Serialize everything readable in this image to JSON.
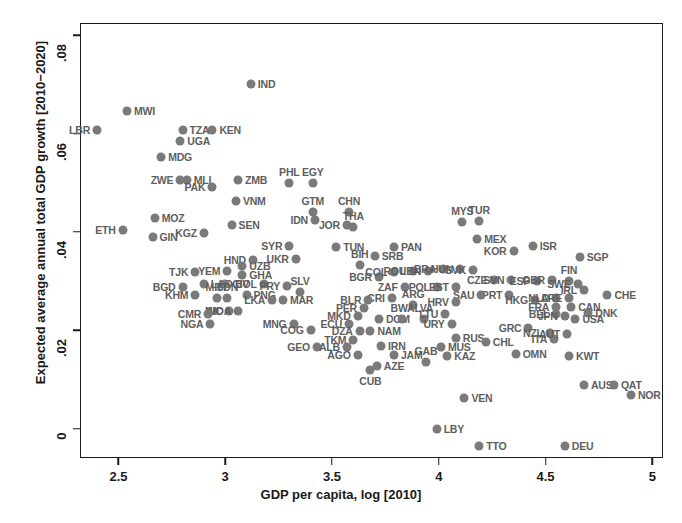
{
  "chart_data": {
    "type": "scatter",
    "title": "",
    "xlabel": "GDP per capita, log [2010]",
    "ylabel": "Expected average annual total GDP growth [2010−2020]",
    "xlim": [
      2.32,
      5.05
    ],
    "ylim": [
      -0.006,
      0.0825
    ],
    "xticks": [
      "2.5",
      "3",
      "3.5",
      "4",
      "4.5",
      "5"
    ],
    "xtick_values": [
      2.5,
      3,
      3.5,
      4,
      4.5,
      5
    ],
    "yticks": [
      "0",
      ".02",
      ".04",
      ".06",
      ".08"
    ],
    "ytick_values": [
      0,
      0.02,
      0.04,
      0.06,
      0.08
    ],
    "grid": false,
    "legend": null,
    "marker_color": "#7a7a7a",
    "label_color": "#5e5e5e",
    "axis_color": "#1a1a1a",
    "points": [
      {
        "label": "LBR",
        "x": 2.4,
        "y": 0.0608,
        "lp": "left"
      },
      {
        "label": "MWI",
        "x": 2.54,
        "y": 0.0645,
        "lp": "right"
      },
      {
        "label": "TZA",
        "x": 2.8,
        "y": 0.0608,
        "lp": "right"
      },
      {
        "label": "UGA",
        "x": 2.79,
        "y": 0.0585,
        "lp": "right"
      },
      {
        "label": "KEN",
        "x": 2.94,
        "y": 0.0608,
        "lp": "right"
      },
      {
        "label": "MDG",
        "x": 2.7,
        "y": 0.0553,
        "lp": "right"
      },
      {
        "label": "ZWE",
        "x": 2.79,
        "y": 0.0505,
        "lp": "left"
      },
      {
        "label": "MLI",
        "x": 2.82,
        "y": 0.0505,
        "lp": "right"
      },
      {
        "label": "PAK",
        "x": 2.94,
        "y": 0.0492,
        "lp": "left"
      },
      {
        "label": "ZMB",
        "x": 3.06,
        "y": 0.0505,
        "lp": "right"
      },
      {
        "label": "PHL",
        "x": 3.3,
        "y": 0.05,
        "lp": "above"
      },
      {
        "label": "EGY",
        "x": 3.41,
        "y": 0.05,
        "lp": "above"
      },
      {
        "label": "IND",
        "x": 3.12,
        "y": 0.07,
        "lp": "right"
      },
      {
        "label": "VNM",
        "x": 3.05,
        "y": 0.0462,
        "lp": "right"
      },
      {
        "label": "MOZ",
        "x": 2.67,
        "y": 0.0428,
        "lp": "right"
      },
      {
        "label": "ETH",
        "x": 2.52,
        "y": 0.0403,
        "lp": "left"
      },
      {
        "label": "GIN",
        "x": 2.66,
        "y": 0.039,
        "lp": "right"
      },
      {
        "label": "KGZ",
        "x": 2.9,
        "y": 0.0398,
        "lp": "left"
      },
      {
        "label": "SEN",
        "x": 3.03,
        "y": 0.0415,
        "lp": "right"
      },
      {
        "label": "GTM",
        "x": 3.41,
        "y": 0.044,
        "lp": "above"
      },
      {
        "label": "IDN",
        "x": 3.42,
        "y": 0.0425,
        "lp": "left"
      },
      {
        "label": "CHN",
        "x": 3.58,
        "y": 0.044,
        "lp": "above"
      },
      {
        "label": "JOR",
        "x": 3.57,
        "y": 0.0415,
        "lp": "left"
      },
      {
        "label": "THA",
        "x": 3.6,
        "y": 0.041,
        "lp": "above"
      },
      {
        "label": "MYS",
        "x": 4.11,
        "y": 0.042,
        "lp": "above"
      },
      {
        "label": "TUR",
        "x": 4.19,
        "y": 0.0422,
        "lp": "above"
      },
      {
        "label": "MEX",
        "x": 4.18,
        "y": 0.0385,
        "lp": "right"
      },
      {
        "label": "SYR",
        "x": 3.3,
        "y": 0.0372,
        "lp": "left"
      },
      {
        "label": "HND",
        "x": 3.13,
        "y": 0.0343,
        "lp": "left"
      },
      {
        "label": "UKR",
        "x": 3.33,
        "y": 0.0345,
        "lp": "left"
      },
      {
        "label": "TUN",
        "x": 3.52,
        "y": 0.037,
        "lp": "right"
      },
      {
        "label": "PAN",
        "x": 3.79,
        "y": 0.037,
        "lp": "right"
      },
      {
        "label": "SRB",
        "x": 3.7,
        "y": 0.035,
        "lp": "right"
      },
      {
        "label": "BIH",
        "x": 3.63,
        "y": 0.0332,
        "lp": "above"
      },
      {
        "label": "UZB",
        "x": 3.08,
        "y": 0.033,
        "lp": "right"
      },
      {
        "label": "GHA",
        "x": 3.08,
        "y": 0.0312,
        "lp": "right"
      },
      {
        "label": "YEM",
        "x": 3.01,
        "y": 0.032,
        "lp": "left"
      },
      {
        "label": "TJK",
        "x": 2.86,
        "y": 0.0318,
        "lp": "left"
      },
      {
        "label": "BGD",
        "x": 2.8,
        "y": 0.0288,
        "lp": "left"
      },
      {
        "label": "LAO",
        "x": 2.9,
        "y": 0.0295,
        "lp": "right"
      },
      {
        "label": "CIV",
        "x": 3.0,
        "y": 0.0295,
        "lp": "right"
      },
      {
        "label": "KHM",
        "x": 2.86,
        "y": 0.0272,
        "lp": "left"
      },
      {
        "label": "BOL",
        "x": 3.18,
        "y": 0.0295,
        "lp": "left"
      },
      {
        "label": "PRY",
        "x": 3.29,
        "y": 0.029,
        "lp": "left"
      },
      {
        "label": "PNG",
        "x": 3.1,
        "y": 0.0272,
        "lp": "right"
      },
      {
        "label": "MRT",
        "x": 2.96,
        "y": 0.0265,
        "lp": "above"
      },
      {
        "label": "SDN",
        "x": 3.01,
        "y": 0.0265,
        "lp": "above"
      },
      {
        "label": "LKA",
        "x": 3.22,
        "y": 0.0262,
        "lp": "left"
      },
      {
        "label": "MAR",
        "x": 3.27,
        "y": 0.0262,
        "lp": "right"
      },
      {
        "label": "SLV",
        "x": 3.35,
        "y": 0.0278,
        "lp": "above"
      },
      {
        "label": "BGR",
        "x": 3.72,
        "y": 0.0308,
        "lp": "left"
      },
      {
        "label": "COL",
        "x": 3.79,
        "y": 0.0318,
        "lp": "left"
      },
      {
        "label": "ROU",
        "x": 3.88,
        "y": 0.032,
        "lp": "left"
      },
      {
        "label": "LBN",
        "x": 3.95,
        "y": 0.032,
        "lp": "left"
      },
      {
        "label": "BRA",
        "x": 4.02,
        "y": 0.0325,
        "lp": "left"
      },
      {
        "label": "HUN",
        "x": 4.1,
        "y": 0.0325,
        "lp": "left"
      },
      {
        "label": "SVK",
        "x": 4.16,
        "y": 0.0322,
        "lp": "left"
      },
      {
        "label": "CZE",
        "x": 4.26,
        "y": 0.0302,
        "lp": "left"
      },
      {
        "label": "SVN",
        "x": 4.34,
        "y": 0.0302,
        "lp": "left"
      },
      {
        "label": "KOR",
        "x": 4.35,
        "y": 0.0362,
        "lp": "left"
      },
      {
        "label": "ISR",
        "x": 4.44,
        "y": 0.0372,
        "lp": "right"
      },
      {
        "label": "SGP",
        "x": 4.66,
        "y": 0.0348,
        "lp": "right"
      },
      {
        "label": "ESP",
        "x": 4.46,
        "y": 0.03,
        "lp": "left"
      },
      {
        "label": "GBR",
        "x": 4.53,
        "y": 0.0302,
        "lp": "left"
      },
      {
        "label": "FIN",
        "x": 4.61,
        "y": 0.03,
        "lp": "above"
      },
      {
        "label": "SWE",
        "x": 4.65,
        "y": 0.0295,
        "lp": "left"
      },
      {
        "label": "IRL",
        "x": 4.68,
        "y": 0.0282,
        "lp": "left"
      },
      {
        "label": "CHE",
        "x": 4.79,
        "y": 0.0272,
        "lp": "right"
      },
      {
        "label": "ZAF",
        "x": 3.84,
        "y": 0.0288,
        "lp": "left"
      },
      {
        "label": "POL",
        "x": 3.99,
        "y": 0.0288,
        "lp": "left"
      },
      {
        "label": "EST",
        "x": 4.08,
        "y": 0.0288,
        "lp": "left"
      },
      {
        "label": "PRT",
        "x": 4.33,
        "y": 0.0272,
        "lp": "left"
      },
      {
        "label": "SAU",
        "x": 4.2,
        "y": 0.0272,
        "lp": "left"
      },
      {
        "label": "HKG",
        "x": 4.45,
        "y": 0.0262,
        "lp": "left"
      },
      {
        "label": "NLD",
        "x": 4.55,
        "y": 0.0265,
        "lp": "left"
      },
      {
        "label": "ARE",
        "x": 4.61,
        "y": 0.0265,
        "lp": "left"
      },
      {
        "label": "CRI",
        "x": 3.78,
        "y": 0.0265,
        "lp": "left"
      },
      {
        "label": "BLR",
        "x": 3.67,
        "y": 0.0262,
        "lp": "left"
      },
      {
        "label": "PER",
        "x": 3.65,
        "y": 0.0245,
        "lp": "left"
      },
      {
        "label": "ARG",
        "x": 3.88,
        "y": 0.0252,
        "lp": "above"
      },
      {
        "label": "HRV",
        "x": 4.08,
        "y": 0.0258,
        "lp": "left"
      },
      {
        "label": "FRA",
        "x": 4.55,
        "y": 0.0248,
        "lp": "left"
      },
      {
        "label": "CAN",
        "x": 4.62,
        "y": 0.0248,
        "lp": "right"
      },
      {
        "label": "DNK",
        "x": 4.7,
        "y": 0.0235,
        "lp": "right"
      },
      {
        "label": "BEL",
        "x": 4.55,
        "y": 0.0232,
        "lp": "left"
      },
      {
        "label": "JPN",
        "x": 4.59,
        "y": 0.0228,
        "lp": "left"
      },
      {
        "label": "USA",
        "x": 4.64,
        "y": 0.0222,
        "lp": "right"
      },
      {
        "label": "MKD",
        "x": 3.62,
        "y": 0.0228,
        "lp": "left"
      },
      {
        "label": "DOM",
        "x": 3.72,
        "y": 0.0222,
        "lp": "right"
      },
      {
        "label": "BWA",
        "x": 3.83,
        "y": 0.0222,
        "lp": "above"
      },
      {
        "label": "LVA",
        "x": 3.93,
        "y": 0.0222,
        "lp": "above"
      },
      {
        "label": "LTU",
        "x": 4.03,
        "y": 0.0232,
        "lp": "left"
      },
      {
        "label": "URY",
        "x": 4.06,
        "y": 0.0212,
        "lp": "left"
      },
      {
        "label": "GRC",
        "x": 4.42,
        "y": 0.0205,
        "lp": "left"
      },
      {
        "label": "NZL",
        "x": 4.52,
        "y": 0.0195,
        "lp": "left"
      },
      {
        "label": "ITA",
        "x": 4.54,
        "y": 0.0182,
        "lp": "left"
      },
      {
        "label": "AUT",
        "x": 4.6,
        "y": 0.0192,
        "lp": "left"
      },
      {
        "label": "NIC",
        "x": 3.02,
        "y": 0.024,
        "lp": "left"
      },
      {
        "label": "MDA",
        "x": 3.06,
        "y": 0.024,
        "lp": "left"
      },
      {
        "label": "CMR",
        "x": 2.92,
        "y": 0.0232,
        "lp": "left"
      },
      {
        "label": "NGA",
        "x": 2.93,
        "y": 0.0212,
        "lp": "left"
      },
      {
        "label": "MNG",
        "x": 3.32,
        "y": 0.0212,
        "lp": "left"
      },
      {
        "label": "ECU",
        "x": 3.58,
        "y": 0.0212,
        "lp": "left"
      },
      {
        "label": "COG",
        "x": 3.4,
        "y": 0.02,
        "lp": "left"
      },
      {
        "label": "DZA",
        "x": 3.63,
        "y": 0.0198,
        "lp": "left"
      },
      {
        "label": "NAM",
        "x": 3.68,
        "y": 0.0198,
        "lp": "right"
      },
      {
        "label": "TKM",
        "x": 3.6,
        "y": 0.018,
        "lp": "left"
      },
      {
        "label": "RUS",
        "x": 4.08,
        "y": 0.0185,
        "lp": "right"
      },
      {
        "label": "GEO",
        "x": 3.43,
        "y": 0.0165,
        "lp": "left"
      },
      {
        "label": "ALB",
        "x": 3.57,
        "y": 0.0165,
        "lp": "left"
      },
      {
        "label": "IRN",
        "x": 3.73,
        "y": 0.0168,
        "lp": "right"
      },
      {
        "label": "AGO",
        "x": 3.62,
        "y": 0.015,
        "lp": "left"
      },
      {
        "label": "JAM",
        "x": 3.79,
        "y": 0.015,
        "lp": "right"
      },
      {
        "label": "MUS",
        "x": 4.01,
        "y": 0.0165,
        "lp": "right"
      },
      {
        "label": "CHL",
        "x": 4.22,
        "y": 0.0175,
        "lp": "right"
      },
      {
        "label": "KAZ",
        "x": 4.04,
        "y": 0.0148,
        "lp": "right"
      },
      {
        "label": "AZE",
        "x": 3.71,
        "y": 0.0128,
        "lp": "right"
      },
      {
        "label": "GAB",
        "x": 3.94,
        "y": 0.0135,
        "lp": "above"
      },
      {
        "label": "CUB",
        "x": 3.68,
        "y": 0.012,
        "lp": "below"
      },
      {
        "label": "OMN",
        "x": 4.36,
        "y": 0.0152,
        "lp": "right"
      },
      {
        "label": "KWT",
        "x": 4.61,
        "y": 0.0148,
        "lp": "right"
      },
      {
        "label": "AUS",
        "x": 4.68,
        "y": 0.0088,
        "lp": "right"
      },
      {
        "label": "QAT",
        "x": 4.82,
        "y": 0.0088,
        "lp": "right"
      },
      {
        "label": "NOR",
        "x": 4.9,
        "y": 0.0068,
        "lp": "right"
      },
      {
        "label": "VEN",
        "x": 4.12,
        "y": 0.0062,
        "lp": "right"
      },
      {
        "label": "LBY",
        "x": 3.99,
        "y": 0.0,
        "lp": "right"
      },
      {
        "label": "TTO",
        "x": 4.19,
        "y": -0.0035,
        "lp": "right"
      },
      {
        "label": "DEU",
        "x": 4.59,
        "y": -0.0035,
        "lp": "right"
      }
    ]
  }
}
